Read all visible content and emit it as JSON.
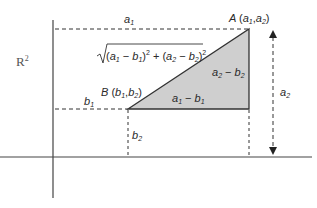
{
  "diagram": {
    "space_label": "R",
    "space_exponent": "2",
    "point_a": {
      "name": "A",
      "coords": "(a1,a2)",
      "x_sub": "1",
      "y_sub": "2"
    },
    "point_b": {
      "name": "B",
      "coords": "(b1,b2)",
      "x_sub": "1",
      "y_sub": "2"
    },
    "labels": {
      "a1": "a1",
      "a2": "a2",
      "b1": "b1",
      "b2": "b2",
      "horizontal_leg": "a1 − b1",
      "vertical_leg": "a2 − b2",
      "hypotenuse": "√((a1 − b1)² + (a2 − b2)²)"
    },
    "colors": {
      "triangle_fill": "#cfcfcf",
      "line": "#333333",
      "axis": "#444444"
    }
  }
}
